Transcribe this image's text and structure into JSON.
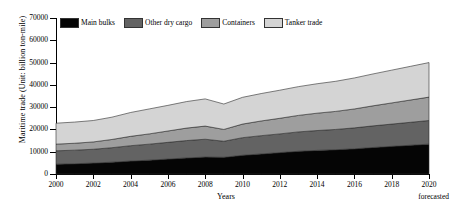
{
  "chart_data": {
    "type": "area",
    "title": "",
    "xlabel": "Years",
    "ylabel": "Maritime trade (Unit: billion ton-mile)",
    "ylim": [
      0,
      70000
    ],
    "ytick_labels": [
      "0",
      "10000",
      "20000",
      "30000",
      "40000",
      "50000",
      "60000",
      "70000"
    ],
    "ytick_values": [
      0,
      10000,
      20000,
      30000,
      40000,
      50000,
      60000,
      70000
    ],
    "xlim": [
      2000,
      2020
    ],
    "xtick_labels": [
      "2000",
      "2002",
      "2004",
      "2006",
      "2008",
      "2010",
      "2012",
      "2014",
      "2016",
      "2018",
      "2020"
    ],
    "xtick_values": [
      2000,
      2002,
      2004,
      2006,
      2008,
      2010,
      2012,
      2014,
      2016,
      2018,
      2020
    ],
    "x": [
      2000,
      2001,
      2002,
      2003,
      2004,
      2005,
      2006,
      2007,
      2008,
      2009,
      2010,
      2011,
      2012,
      2013,
      2014,
      2015,
      2016,
      2017,
      2018,
      2019,
      2020
    ],
    "stacked": true,
    "grid": false,
    "legend_position": "top-left",
    "annotation": "forecasted",
    "series": [
      {
        "name": "Main bulks",
        "color": "#050505",
        "values": [
          4400,
          4600,
          4900,
          5300,
          5800,
          6200,
          6700,
          7200,
          7600,
          7500,
          8400,
          9000,
          9600,
          10200,
          10600,
          10900,
          11300,
          11900,
          12400,
          12900,
          13400
        ]
      },
      {
        "name": "Other dry cargo",
        "color": "#636363",
        "values": [
          6000,
          6100,
          6200,
          6500,
          6900,
          7200,
          7500,
          7800,
          8000,
          7200,
          7900,
          8200,
          8400,
          8700,
          8900,
          9100,
          9400,
          9700,
          10000,
          10300,
          10600
        ]
      },
      {
        "name": "Containers",
        "color": "#9e9e9e",
        "values": [
          3000,
          3100,
          3300,
          3700,
          4200,
          4600,
          5100,
          5600,
          5900,
          5300,
          6100,
          6600,
          7000,
          7400,
          7800,
          8100,
          8500,
          9000,
          9500,
          10000,
          10500
        ]
      },
      {
        "name": "Tanker trade",
        "color": "#d4d4d4",
        "values": [
          9400,
          9500,
          9600,
          10000,
          10700,
          11200,
          11500,
          11900,
          12200,
          11400,
          12000,
          12300,
          12600,
          12900,
          13200,
          13500,
          13900,
          14300,
          14700,
          15100,
          15500
        ]
      }
    ]
  }
}
